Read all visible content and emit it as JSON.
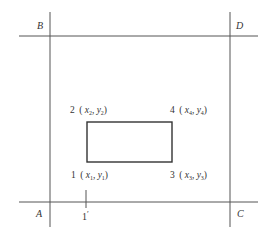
{
  "diagram": {
    "type": "control-point layout",
    "corners": {
      "A": "A",
      "B": "B",
      "C": "C",
      "D": "D"
    },
    "points": [
      {
        "id": "1",
        "x": "x",
        "xs": "1",
        "y": "y",
        "ys": "1"
      },
      {
        "id": "2",
        "x": "x",
        "xs": "2",
        "y": "y",
        "ys": "2"
      },
      {
        "id": "3",
        "x": "x",
        "xs": "3",
        "y": "y",
        "ys": "3"
      },
      {
        "id": "4",
        "x": "x",
        "xs": "4",
        "y": "y",
        "ys": "4"
      }
    ],
    "tick": {
      "label": "1",
      "prime": "′"
    },
    "punct": {
      "open": "(",
      "comma": ",",
      "close": ")"
    },
    "colors": {
      "line": "#555555",
      "rect": "#333333",
      "text": "#333333",
      "background": "#ffffff"
    }
  }
}
